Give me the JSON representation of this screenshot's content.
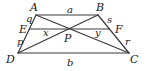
{
  "diagram": {
    "type": "trapezoid-geometry",
    "vertices": {
      "A": {
        "label": "A",
        "x": 36,
        "y": 15
      },
      "B": {
        "label": "B",
        "x": 98,
        "y": 15
      },
      "C": {
        "label": "C",
        "x": 129,
        "y": 53
      },
      "D": {
        "label": "D",
        "x": 18,
        "y": 53
      },
      "E": {
        "label": "E",
        "x": 29.5,
        "y": 29
      },
      "F": {
        "label": "F",
        "x": 109.5,
        "y": 29
      },
      "P": {
        "label": "P",
        "x": 68,
        "y": 29
      }
    },
    "segment_labels": {
      "a": "a",
      "b": "b",
      "q": "q",
      "p": "p",
      "s": "s",
      "r": "r",
      "x": "x",
      "y": "y"
    },
    "edges": [
      {
        "from": "A",
        "to": "B",
        "name": "top-base-AB"
      },
      {
        "from": "B",
        "to": "C",
        "name": "right-leg-BC"
      },
      {
        "from": "C",
        "to": "D",
        "name": "bottom-base-CD"
      },
      {
        "from": "D",
        "to": "A",
        "name": "left-leg-DA"
      },
      {
        "from": "A",
        "to": "C",
        "name": "diagonal-AC"
      },
      {
        "from": "B",
        "to": "D",
        "name": "diagonal-BD"
      },
      {
        "from": "E",
        "to": "F",
        "name": "segment-EF"
      }
    ],
    "stroke_color": "#3a3a3a",
    "text_color": "#1a1a1a"
  }
}
